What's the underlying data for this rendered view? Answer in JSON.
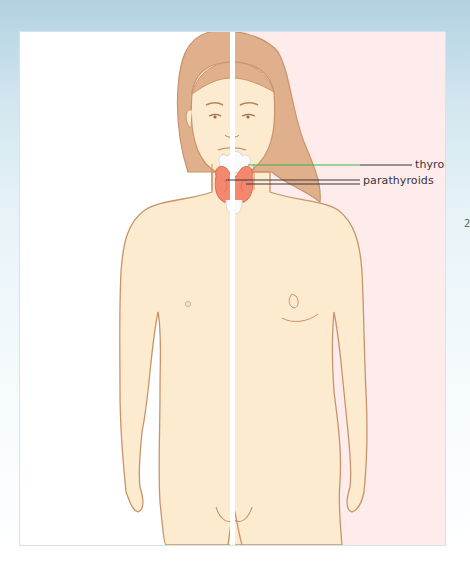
{
  "figure": {
    "background_left": "#ffffff",
    "background_right": "#fdeceb",
    "skin_color": "#fdebcf",
    "outline_color": "#c9936a",
    "hair_color": "#e0b08c",
    "gland_color": "#f3886e",
    "labels": [
      {
        "text": "thyroid",
        "leader_color": "#3bb34a"
      },
      {
        "text": "parathyroids",
        "leader_color": "#3a3438"
      }
    ]
  },
  "margin": {
    "partial_glyph": "2"
  }
}
